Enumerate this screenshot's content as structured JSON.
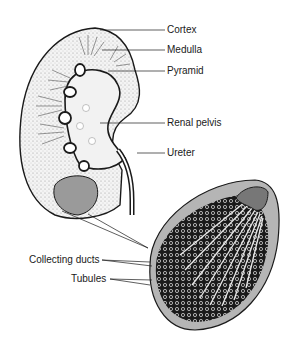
{
  "diagram": {
    "labels": {
      "cortex": "Cortex",
      "medulla": "Medulla",
      "pyramid": "Pyramid",
      "renal_pelvis": "Renal pelvis",
      "ureter": "Ureter",
      "collecting_ducts": "Collecting ducts",
      "tubules": "Tubules"
    },
    "colors": {
      "outline": "#1a1a1a",
      "stipple": "#e6e6e6",
      "pelvis": "#f2f2f2",
      "pyramid_fill": "#9a9a9a",
      "detail_bg": "#b5b5b5"
    }
  }
}
